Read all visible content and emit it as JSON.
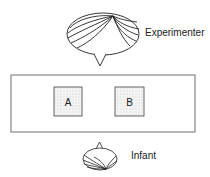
{
  "diagram": {
    "experimenter": {
      "label": "Experimenter"
    },
    "infant": {
      "label": "Infant"
    },
    "table": {
      "boxes": [
        {
          "label": "A"
        },
        {
          "label": "B"
        }
      ]
    }
  },
  "colors": {
    "stroke": "#222222",
    "table_stroke": "#888888",
    "box_fill": "#f2f2f2"
  }
}
